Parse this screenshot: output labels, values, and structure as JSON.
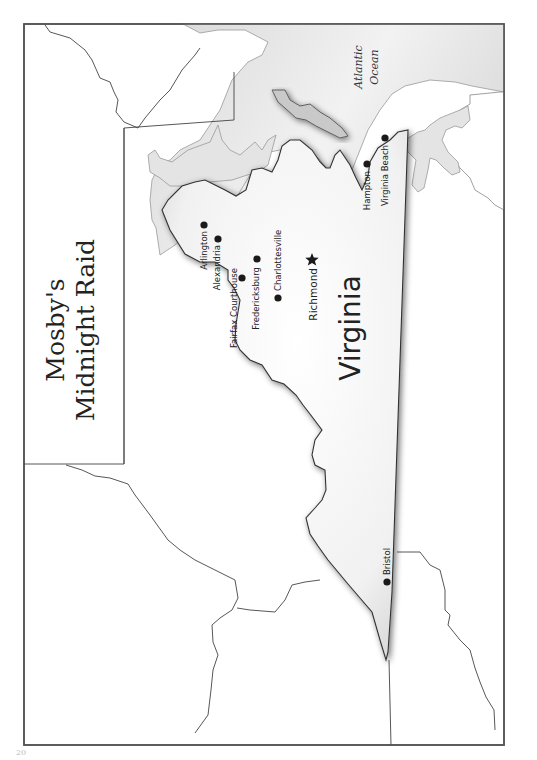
{
  "map": {
    "title_line1": "Mosby's",
    "title_line2": "Midnight Raid",
    "state_label": "Virginia",
    "water_label_line1": "Atlantic",
    "water_label_line2": "Ocean",
    "orientation": "rotated-90-clockwise",
    "colors": {
      "border": "#555555",
      "state_fill": "#f4f4f4",
      "state_shadow": "#8a8a8a",
      "water": "#e2e2e2",
      "water_edge": "#9a9a9a",
      "land": "#ffffff",
      "marker": "#1a1a1a"
    },
    "cities": [
      {
        "name": "Arlington",
        "marker": "dot"
      },
      {
        "name": "Alexandria",
        "marker": "dot"
      },
      {
        "name": "Fairfax Courthouse",
        "marker": "dot"
      },
      {
        "name": "Fredericksburg",
        "marker": "dot"
      },
      {
        "name": "Charlottesville",
        "marker": "dot"
      },
      {
        "name": "Richmond",
        "marker": "star",
        "capital": true
      },
      {
        "name": "Hampton",
        "marker": "dot"
      },
      {
        "name": "Virginia Beach",
        "marker": "dot"
      },
      {
        "name": "Bristol",
        "marker": "dot"
      }
    ]
  },
  "page": {
    "number": "20"
  }
}
